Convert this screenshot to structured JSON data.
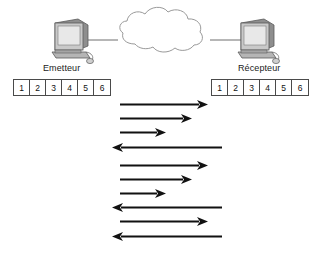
{
  "diagram": {
    "background_color": "#ffffff",
    "line_color": "#111111"
  },
  "topology": {
    "emitter": {
      "label": "Emetteur",
      "icon": "computer-icon"
    },
    "receiver": {
      "label": "Récepteur",
      "icon": "computer-icon"
    },
    "network": {
      "icon": "cloud-icon",
      "label": ""
    }
  },
  "sequence_boxes": {
    "emitter": [
      "1",
      "2",
      "3",
      "4",
      "5",
      "6"
    ],
    "receiver": [
      "1",
      "2",
      "3",
      "4",
      "5",
      "6"
    ]
  },
  "messages": [
    {
      "label": "Envoie 1",
      "direction": "right",
      "side": "left",
      "y": 104,
      "tail": 120,
      "tip": 208
    },
    {
      "label": "Envoie 2",
      "direction": "right",
      "side": "left",
      "y": 118,
      "tail": 120,
      "tip": 192
    },
    {
      "label": "Envoie 3",
      "direction": "right",
      "side": "left",
      "y": 132,
      "tail": 120,
      "tip": 166
    },
    {
      "label": "Acquittement 4",
      "direction": "left",
      "side": "right",
      "y": 147,
      "tail": 222,
      "tip": 112
    },
    {
      "label": "Envoie 4",
      "direction": "right",
      "side": "left",
      "y": 165,
      "tail": 120,
      "tip": 208
    },
    {
      "label": "Envoie 5",
      "direction": "right",
      "side": "left",
      "y": 179,
      "tail": 120,
      "tip": 192
    },
    {
      "label": "Envoie 6",
      "direction": "right",
      "side": "left",
      "y": 193,
      "tail": 120,
      "tip": 166
    },
    {
      "label": "Acquittement 5",
      "direction": "left",
      "side": "right",
      "y": 207,
      "tail": 222,
      "tip": 112
    },
    {
      "label": "Envoie 5",
      "direction": "right",
      "side": "left",
      "y": 221,
      "tail": 120,
      "tip": 208
    },
    {
      "label": "Acquittement 7",
      "direction": "left",
      "side": "right",
      "y": 236,
      "tail": 222,
      "tip": 112
    }
  ]
}
